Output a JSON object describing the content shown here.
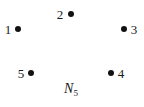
{
  "diagram": {
    "type": "graph",
    "caption": {
      "main": "N",
      "subscript": "5"
    },
    "vertices": [
      {
        "id": "1",
        "label": "1",
        "x": 18,
        "y": 29,
        "label_x": 8,
        "label_y": 29
      },
      {
        "id": "2",
        "label": "2",
        "x": 71,
        "y": 14,
        "label_x": 60,
        "label_y": 14
      },
      {
        "id": "3",
        "label": "3",
        "x": 124,
        "y": 29,
        "label_x": 134,
        "label_y": 29
      },
      {
        "id": "4",
        "label": "4",
        "x": 111,
        "y": 73,
        "label_x": 121,
        "label_y": 73
      },
      {
        "id": "5",
        "label": "5",
        "x": 31,
        "y": 73,
        "label_x": 21,
        "label_y": 73
      }
    ],
    "edges": [],
    "colors": {
      "vertex": "#111111",
      "text": "#1a1a1a",
      "background": "#ffffff"
    }
  }
}
